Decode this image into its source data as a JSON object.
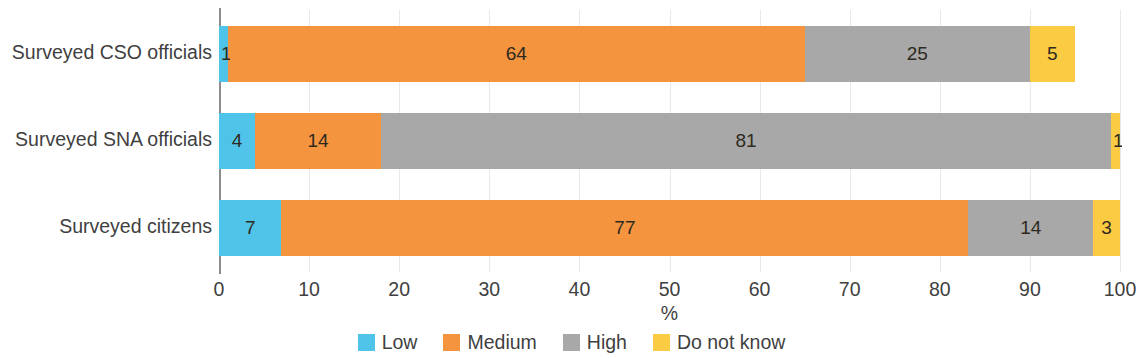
{
  "chart_data": {
    "type": "bar",
    "orientation": "horizontal",
    "stacked": true,
    "stack_mode": "percent",
    "title": "",
    "subtitle": "",
    "xlabel": "%",
    "ylabel": "",
    "xlim": [
      0,
      100
    ],
    "xticks": [
      0,
      10,
      20,
      30,
      40,
      50,
      60,
      70,
      80,
      90,
      100
    ],
    "xtick_labels": [
      "0",
      "10",
      "20",
      "30",
      "40",
      "50",
      "60",
      "70",
      "80",
      "90",
      "100"
    ],
    "grid": true,
    "grid_axis": "x",
    "legend_position": "bottom-center",
    "categories": [
      "Surveyed CSO officials",
      "Surveyed SNA officials",
      "Surveyed citizens"
    ],
    "series": [
      {
        "name": "Low",
        "color": "#4FC3E8",
        "values": [
          1,
          4,
          7
        ]
      },
      {
        "name": "Medium",
        "color": "#F5943F",
        "values": [
          64,
          14,
          77
        ]
      },
      {
        "name": "High",
        "color": "#A8A8A8",
        "values": [
          25,
          81,
          14
        ]
      },
      {
        "name": "Do not know",
        "color": "#FBCB43",
        "values": [
          5,
          1,
          3
        ]
      }
    ],
    "bars": [
      {
        "category": "Surveyed CSO officials",
        "segments": [
          {
            "series": "Low",
            "value": 1,
            "label": "1",
            "color": "#4FC3E8"
          },
          {
            "series": "Medium",
            "value": 64,
            "label": "64",
            "color": "#F5943F"
          },
          {
            "series": "High",
            "value": 25,
            "label": "25",
            "color": "#A8A8A8"
          },
          {
            "series": "Do not know",
            "value": 5,
            "label": "5",
            "color": "#FBCB43"
          }
        ]
      },
      {
        "category": "Surveyed SNA officials",
        "segments": [
          {
            "series": "Low",
            "value": 4,
            "label": "4",
            "color": "#4FC3E8"
          },
          {
            "series": "Medium",
            "value": 14,
            "label": "14",
            "color": "#F5943F"
          },
          {
            "series": "High",
            "value": 81,
            "label": "81",
            "color": "#A8A8A8"
          },
          {
            "series": "Do not know",
            "value": 1,
            "label": "1",
            "color": "#FBCB43"
          }
        ]
      },
      {
        "category": "Surveyed citizens",
        "segments": [
          {
            "series": "Low",
            "value": 7,
            "label": "7",
            "color": "#4FC3E8"
          },
          {
            "series": "Medium",
            "value": 77,
            "label": "77",
            "color": "#F5943F"
          },
          {
            "series": "High",
            "value": 14,
            "label": "14",
            "color": "#A8A8A8"
          },
          {
            "series": "Do not know",
            "value": 3,
            "label": "3",
            "color": "#FBCB43"
          }
        ]
      }
    ],
    "legend": [
      {
        "label": "Low",
        "color": "#4FC3E8"
      },
      {
        "label": "Medium",
        "color": "#F5943F"
      },
      {
        "label": "High",
        "color": "#A8A8A8"
      },
      {
        "label": "Do not know",
        "color": "#FBCB43"
      }
    ]
  },
  "axis": {
    "x_title": "%"
  },
  "colors": {
    "low": "#4FC3E8",
    "medium": "#F5943F",
    "high": "#A8A8A8",
    "do_not_know": "#FBCB43",
    "axis_line": "#8c8c8c",
    "gridline": "#e9e9e9",
    "text": "#3f3f3f",
    "background": "#ffffff"
  }
}
